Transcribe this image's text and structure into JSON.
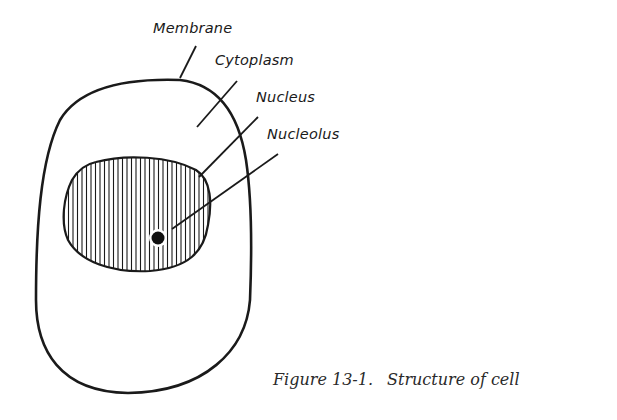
{
  "diagram": {
    "title": "Structure of cell",
    "labels": {
      "membrane": "Membrane",
      "cytoplasm": "Cytoplasm",
      "nucleus": "Nucleus",
      "nucleolus": "Nucleolus"
    },
    "caption": {
      "figure_number": "Figure 13-1.",
      "text": "Structure of cell"
    },
    "colors": {
      "ink": "#1a1a1a",
      "background": "#ffffff"
    }
  }
}
